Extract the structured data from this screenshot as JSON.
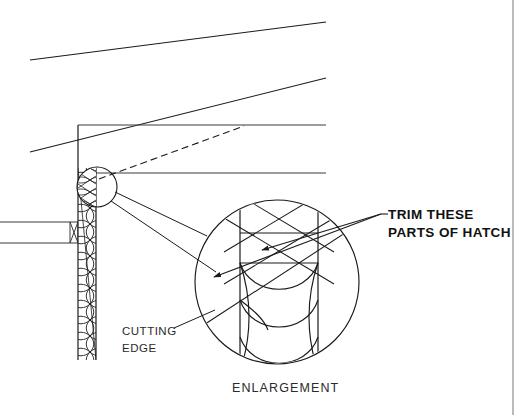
{
  "drawing": {
    "type": "architectural-detail",
    "background_color": "#ffffff",
    "line_color": "#1a1a1a",
    "thin_line_color": "#555555",
    "border": {
      "right_rule_x": 513,
      "visible": true
    },
    "annotations": [
      {
        "id": "trim-note",
        "lines": [
          "TRIM THESE",
          "PARTS OF HATCH"
        ],
        "style": "bold",
        "x": 385,
        "y": 214,
        "leader_count": 2
      },
      {
        "id": "cutting-edge-note",
        "lines": [
          "CUTTING",
          "EDGE"
        ],
        "style": "plain",
        "x": 122,
        "y": 331,
        "leader_count": 1
      },
      {
        "id": "enlargement-title",
        "lines": [
          "ENLARGEMENT"
        ],
        "style": "title",
        "x": 232,
        "y": 389,
        "leader_count": 0
      }
    ],
    "wall": {
      "name": "insulated-wall-section",
      "left_x": 78,
      "right_x": 96,
      "top_y": 168,
      "bottom_y": 360,
      "hatch": "batt-insulation"
    },
    "roof": {
      "name": "sloped-roof-lines",
      "upper_line": {
        "x1": 30,
        "y1": 60,
        "x2": 326,
        "y2": 22
      },
      "lower_line": {
        "x1": 30,
        "y1": 152,
        "x2": 326,
        "y2": 78
      }
    },
    "horizontals": [
      {
        "name": "ceiling-line-upper",
        "x1": 78,
        "y1": 125,
        "x2": 326,
        "y2": 125
      },
      {
        "name": "ceiling-line-lower",
        "x1": 96,
        "y1": 173,
        "x2": 326,
        "y2": 173
      }
    ],
    "dashed_line": {
      "name": "hidden-line",
      "x1": 96,
      "y1": 178,
      "x2": 243,
      "y2": 127,
      "dash": "6 4"
    },
    "ledge": {
      "name": "floor-ledge",
      "x1": 0,
      "top_y": 222,
      "bottom_y": 243,
      "right_x": 78
    },
    "detail_bubble": {
      "name": "detail-callout-circle",
      "cx": 97,
      "cy": 187,
      "r": 20
    },
    "enlargement_circle": {
      "name": "enlargement-circle",
      "cx": 277,
      "cy": 282,
      "r": 82,
      "wall_left_x": 240,
      "wall_right_x": 318,
      "trim_band_top_y": 233,
      "trim_band_bottom_y": 263
    },
    "leaders": [
      {
        "name": "bubble-to-enlargement-upper",
        "x1": 114,
        "y1": 193,
        "x2": 205,
        "y2": 235
      },
      {
        "name": "bubble-to-enlargement-lower",
        "x1": 110,
        "y1": 200,
        "x2": 215,
        "y2": 270
      }
    ]
  }
}
